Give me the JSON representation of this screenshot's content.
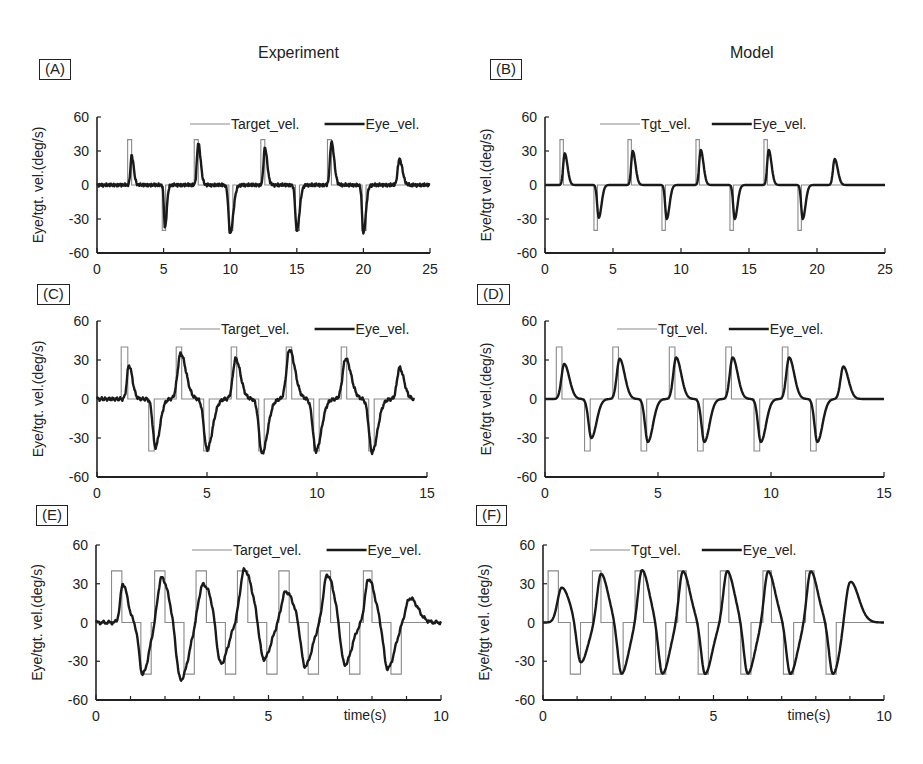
{
  "figure": {
    "column_titles": [
      "Experiment",
      "Model"
    ]
  },
  "chart_data": [
    {
      "panel": "(A)",
      "column": "Experiment",
      "type": "line",
      "ylabel": "Eye/tgt. vel.(deg/s)",
      "xlabel": "",
      "xlim": [
        0,
        25
      ],
      "ylim": [
        -60,
        60
      ],
      "xticks": [
        0,
        5,
        10,
        15,
        20,
        25
      ],
      "yticks": [
        -60,
        -30,
        0,
        30,
        60
      ],
      "legend": [
        "Target_vel.",
        "Eye_vel."
      ],
      "legend_position": "top-right",
      "target": {
        "amplitude": 40,
        "pulses": [
          {
            "t0": 2.3,
            "t1": 2.6,
            "v": 40
          },
          {
            "t0": 4.9,
            "t1": 5.15,
            "v": -40
          },
          {
            "t0": 7.3,
            "t1": 7.6,
            "v": 40
          },
          {
            "t0": 9.9,
            "t1": 10.2,
            "v": -40
          },
          {
            "t0": 12.3,
            "t1": 12.6,
            "v": 40
          },
          {
            "t0": 14.9,
            "t1": 15.2,
            "v": -40
          },
          {
            "t0": 17.3,
            "t1": 17.6,
            "v": 40
          },
          {
            "t0": 19.9,
            "t1": 20.2,
            "v": -40
          }
        ]
      },
      "eye_peaks": [
        {
          "t": 2.6,
          "v": 26,
          "w": 0.35
        },
        {
          "t": 5.1,
          "v": -38,
          "w": 0.3
        },
        {
          "t": 7.6,
          "v": 37,
          "w": 0.4
        },
        {
          "t": 10.0,
          "v": -43,
          "w": 0.5
        },
        {
          "t": 12.6,
          "v": 33,
          "w": 0.4
        },
        {
          "t": 15.0,
          "v": -40,
          "w": 0.45
        },
        {
          "t": 17.6,
          "v": 38,
          "w": 0.45
        },
        {
          "t": 20.0,
          "v": -43,
          "w": 0.4
        },
        {
          "t": 22.7,
          "v": 23,
          "w": 0.5
        }
      ]
    },
    {
      "panel": "(B)",
      "column": "Model",
      "type": "line",
      "ylabel": "Eye/tgt vel.(deg/s)",
      "xlabel": "",
      "xlim": [
        0,
        25
      ],
      "ylim": [
        -60,
        60
      ],
      "xticks": [
        0,
        5,
        10,
        15,
        20,
        25
      ],
      "yticks": [
        -60,
        -30,
        0,
        30,
        60
      ],
      "legend": [
        "Tgt_vel.",
        "Eye_vel."
      ],
      "legend_position": "top-center",
      "target": {
        "amplitude": 40,
        "pulses": [
          {
            "t0": 1.1,
            "t1": 1.35,
            "v": 40
          },
          {
            "t0": 3.6,
            "t1": 3.85,
            "v": -40
          },
          {
            "t0": 6.1,
            "t1": 6.35,
            "v": 40
          },
          {
            "t0": 8.6,
            "t1": 8.85,
            "v": -40
          },
          {
            "t0": 11.1,
            "t1": 11.35,
            "v": 40
          },
          {
            "t0": 13.6,
            "t1": 13.85,
            "v": -40
          },
          {
            "t0": 16.1,
            "t1": 16.35,
            "v": 40
          },
          {
            "t0": 18.6,
            "t1": 18.85,
            "v": -40
          }
        ]
      },
      "eye_peaks": [
        {
          "t": 1.45,
          "v": 28,
          "w": 0.45
        },
        {
          "t": 3.95,
          "v": -29,
          "w": 0.45
        },
        {
          "t": 6.45,
          "v": 30,
          "w": 0.45
        },
        {
          "t": 8.95,
          "v": -30,
          "w": 0.45
        },
        {
          "t": 11.45,
          "v": 31,
          "w": 0.45
        },
        {
          "t": 13.95,
          "v": -30,
          "w": 0.45
        },
        {
          "t": 16.45,
          "v": 31,
          "w": 0.45
        },
        {
          "t": 18.95,
          "v": -30,
          "w": 0.45
        },
        {
          "t": 21.3,
          "v": 23,
          "w": 0.5
        }
      ]
    },
    {
      "panel": "(C)",
      "column": "Experiment",
      "type": "line",
      "ylabel": "Eye/tgt. vel.(deg/s)",
      "xlabel": "",
      "xlim": [
        0,
        15
      ],
      "ylim": [
        -60,
        60
      ],
      "xticks": [
        0,
        5,
        10,
        15
      ],
      "yticks": [
        -60,
        -30,
        0,
        30,
        60
      ],
      "legend": [
        "Target_vel.",
        "Eye_vel."
      ],
      "legend_position": "top-right",
      "target": {
        "amplitude": 40,
        "pulses": [
          {
            "t0": 1.1,
            "t1": 1.4,
            "v": 40
          },
          {
            "t0": 2.35,
            "t1": 2.6,
            "v": -40
          },
          {
            "t0": 3.6,
            "t1": 3.85,
            "v": 40
          },
          {
            "t0": 4.85,
            "t1": 5.1,
            "v": -40
          },
          {
            "t0": 6.1,
            "t1": 6.35,
            "v": 40
          },
          {
            "t0": 7.35,
            "t1": 7.6,
            "v": -40
          },
          {
            "t0": 8.6,
            "t1": 8.85,
            "v": 40
          },
          {
            "t0": 9.85,
            "t1": 10.1,
            "v": -40
          },
          {
            "t0": 11.1,
            "t1": 11.35,
            "v": 40
          },
          {
            "t0": 12.35,
            "t1": 12.6,
            "v": -40
          }
        ]
      },
      "eye_peaks": [
        {
          "t": 1.45,
          "v": 26,
          "w": 0.35
        },
        {
          "t": 2.65,
          "v": -37,
          "w": 0.45
        },
        {
          "t": 3.8,
          "v": 35,
          "w": 0.55
        },
        {
          "t": 5.0,
          "v": -39,
          "w": 0.55
        },
        {
          "t": 6.3,
          "v": 31,
          "w": 0.5
        },
        {
          "t": 7.5,
          "v": -42,
          "w": 0.55
        },
        {
          "t": 8.75,
          "v": 38,
          "w": 0.55
        },
        {
          "t": 9.95,
          "v": -40,
          "w": 0.55
        },
        {
          "t": 11.3,
          "v": 31,
          "w": 0.55
        },
        {
          "t": 12.5,
          "v": -41,
          "w": 0.55
        },
        {
          "t": 13.75,
          "v": 24,
          "w": 0.45
        }
      ],
      "x_end": 14.4
    },
    {
      "panel": "(D)",
      "column": "Model",
      "type": "line",
      "ylabel": "Eye/tgt vel.(deg/s)",
      "xlabel": "",
      "xlim": [
        0,
        15
      ],
      "ylim": [
        -60,
        60
      ],
      "xticks": [
        0,
        5,
        10,
        15
      ],
      "yticks": [
        -60,
        -30,
        0,
        30,
        60
      ],
      "legend": [
        "Tgt_vel.",
        "Eye_vel."
      ],
      "legend_position": "top-center",
      "target": {
        "amplitude": 40,
        "pulses": [
          {
            "t0": 0.5,
            "t1": 0.75,
            "v": 40
          },
          {
            "t0": 1.75,
            "t1": 2.0,
            "v": -40
          },
          {
            "t0": 3.0,
            "t1": 3.25,
            "v": 40
          },
          {
            "t0": 4.25,
            "t1": 4.5,
            "v": -40
          },
          {
            "t0": 5.5,
            "t1": 5.75,
            "v": 40
          },
          {
            "t0": 6.75,
            "t1": 7.0,
            "v": -40
          },
          {
            "t0": 8.0,
            "t1": 8.25,
            "v": 40
          },
          {
            "t0": 9.25,
            "t1": 9.5,
            "v": -40
          },
          {
            "t0": 10.5,
            "t1": 10.75,
            "v": 40
          },
          {
            "t0": 11.75,
            "t1": 12.0,
            "v": -40
          }
        ]
      },
      "eye_peaks": [
        {
          "t": 0.85,
          "v": 27,
          "w": 0.5
        },
        {
          "t": 2.05,
          "v": -30,
          "w": 0.5
        },
        {
          "t": 3.3,
          "v": 31,
          "w": 0.5
        },
        {
          "t": 4.55,
          "v": -33,
          "w": 0.5
        },
        {
          "t": 5.8,
          "v": 32,
          "w": 0.5
        },
        {
          "t": 7.05,
          "v": -33,
          "w": 0.5
        },
        {
          "t": 8.3,
          "v": 32,
          "w": 0.5
        },
        {
          "t": 9.55,
          "v": -33,
          "w": 0.5
        },
        {
          "t": 10.8,
          "v": 32,
          "w": 0.5
        },
        {
          "t": 12.05,
          "v": -33,
          "w": 0.5
        },
        {
          "t": 13.2,
          "v": 25,
          "w": 0.5
        }
      ]
    },
    {
      "panel": "(E)",
      "column": "Experiment",
      "type": "line",
      "ylabel": "Eye/tgt. vel.(deg/s)",
      "xlabel": "time(s)",
      "xlim": [
        0,
        10
      ],
      "ylim": [
        -60,
        60
      ],
      "xticks": [
        0,
        5,
        10
      ],
      "minor_xticks": [
        1,
        2,
        3,
        4,
        6,
        7,
        8,
        9
      ],
      "yticks": [
        -60,
        -30,
        0,
        30,
        60
      ],
      "legend": [
        "Target_vel.",
        "Eye_vel."
      ],
      "legend_position": "top-right",
      "target": {
        "amplitude": 40,
        "pulses": [
          {
            "t0": 0.45,
            "t1": 0.75,
            "v": 40
          },
          {
            "t0": 1.3,
            "t1": 1.6,
            "v": -40
          },
          {
            "t0": 1.7,
            "t1": 2.0,
            "v": 40
          },
          {
            "t0": 2.55,
            "t1": 2.85,
            "v": -40
          },
          {
            "t0": 2.9,
            "t1": 3.2,
            "v": 40
          },
          {
            "t0": 3.75,
            "t1": 4.05,
            "v": -40
          },
          {
            "t0": 4.1,
            "t1": 4.4,
            "v": 40
          },
          {
            "t0": 4.95,
            "t1": 5.25,
            "v": -40
          },
          {
            "t0": 5.3,
            "t1": 5.6,
            "v": 40
          },
          {
            "t0": 6.15,
            "t1": 6.45,
            "v": -40
          },
          {
            "t0": 6.5,
            "t1": 6.8,
            "v": 40
          },
          {
            "t0": 7.35,
            "t1": 7.65,
            "v": -40
          },
          {
            "t0": 7.75,
            "t1": 8.0,
            "v": 40
          },
          {
            "t0": 8.55,
            "t1": 8.85,
            "v": -40
          }
        ]
      },
      "eye_peaks": [
        {
          "t": 0.78,
          "v": 30,
          "w": 0.3
        },
        {
          "t": 1.35,
          "v": -40,
          "w": 0.4
        },
        {
          "t": 1.9,
          "v": 35,
          "w": 0.45
        },
        {
          "t": 2.45,
          "v": -45,
          "w": 0.5
        },
        {
          "t": 3.1,
          "v": 30,
          "w": 0.55
        },
        {
          "t": 3.6,
          "v": -35,
          "w": 0.45
        },
        {
          "t": 4.3,
          "v": 41,
          "w": 0.5
        },
        {
          "t": 4.85,
          "v": -30,
          "w": 0.45
        },
        {
          "t": 5.5,
          "v": 24,
          "w": 0.5
        },
        {
          "t": 6.05,
          "v": -35,
          "w": 0.45
        },
        {
          "t": 6.7,
          "v": 37,
          "w": 0.45
        },
        {
          "t": 7.2,
          "v": -34,
          "w": 0.45
        },
        {
          "t": 7.9,
          "v": 34,
          "w": 0.4
        },
        {
          "t": 8.45,
          "v": -36,
          "w": 0.45
        },
        {
          "t": 9.1,
          "v": 19,
          "w": 0.5
        }
      ]
    },
    {
      "panel": "(F)",
      "column": "Model",
      "type": "line",
      "ylabel": "Eye/tgt vel. (deg/s)",
      "xlabel": "time(s)",
      "xlim": [
        0,
        10
      ],
      "ylim": [
        -60,
        60
      ],
      "xticks": [
        0,
        5,
        10
      ],
      "minor_xticks": [
        1,
        2,
        3,
        4,
        6,
        7,
        8,
        9
      ],
      "yticks": [
        -60,
        -30,
        0,
        30,
        60
      ],
      "legend": [
        "Tgt_vel.",
        "Eye_vel."
      ],
      "legend_position": "top-center",
      "target": {
        "amplitude": 40,
        "pulses": [
          {
            "t0": 0.15,
            "t1": 0.45,
            "v": 40
          },
          {
            "t0": 0.8,
            "t1": 1.1,
            "v": -40
          },
          {
            "t0": 1.45,
            "t1": 1.7,
            "v": 40
          },
          {
            "t0": 2.05,
            "t1": 2.35,
            "v": -40
          },
          {
            "t0": 2.7,
            "t1": 2.95,
            "v": 40
          },
          {
            "t0": 3.3,
            "t1": 3.6,
            "v": -40
          },
          {
            "t0": 3.95,
            "t1": 4.2,
            "v": 40
          },
          {
            "t0": 4.55,
            "t1": 4.85,
            "v": -40
          },
          {
            "t0": 5.2,
            "t1": 5.45,
            "v": 40
          },
          {
            "t0": 5.8,
            "t1": 6.1,
            "v": -40
          },
          {
            "t0": 6.45,
            "t1": 6.7,
            "v": 40
          },
          {
            "t0": 7.05,
            "t1": 7.35,
            "v": -40
          },
          {
            "t0": 7.7,
            "t1": 7.95,
            "v": 40
          },
          {
            "t0": 8.3,
            "t1": 8.6,
            "v": -40
          }
        ]
      },
      "eye_peaks": [
        {
          "t": 0.55,
          "v": 27,
          "w": 0.5
        },
        {
          "t": 1.1,
          "v": -32,
          "w": 0.45
        },
        {
          "t": 1.7,
          "v": 38,
          "w": 0.45
        },
        {
          "t": 2.3,
          "v": -40,
          "w": 0.45
        },
        {
          "t": 2.9,
          "v": 41,
          "w": 0.45
        },
        {
          "t": 3.5,
          "v": -40,
          "w": 0.45
        },
        {
          "t": 4.1,
          "v": 40,
          "w": 0.45
        },
        {
          "t": 4.75,
          "v": -40,
          "w": 0.45
        },
        {
          "t": 5.4,
          "v": 40,
          "w": 0.45
        },
        {
          "t": 6.0,
          "v": -40,
          "w": 0.45
        },
        {
          "t": 6.6,
          "v": 40,
          "w": 0.45
        },
        {
          "t": 7.25,
          "v": -40,
          "w": 0.45
        },
        {
          "t": 7.85,
          "v": 40,
          "w": 0.45
        },
        {
          "t": 8.5,
          "v": -40,
          "w": 0.45
        },
        {
          "t": 9.0,
          "v": 33,
          "w": 0.55
        }
      ]
    }
  ]
}
